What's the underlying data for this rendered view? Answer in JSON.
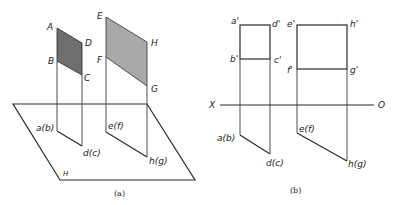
{
  "figure_a": {
    "caption": "(a)",
    "plane_symbol": "H",
    "labels": {
      "A": "A",
      "B": "B",
      "C": "C",
      "D": "D",
      "E": "E",
      "F": "F",
      "G": "G",
      "H": "H",
      "ab": "a(b)",
      "dc": "d(c)",
      "ef": "e(f)",
      "hg": "h(g)"
    },
    "colors": {
      "abcd_fill": "#6e6e6e",
      "efgh_fill": "#a9a9a9"
    }
  },
  "figure_b": {
    "caption": "(b)",
    "axis": {
      "left": "X",
      "right": "O"
    },
    "labels": {
      "a1": "a'",
      "b1": "b'",
      "c1": "c'",
      "d1": "d'",
      "e1": "e'",
      "f1": "f'",
      "g1": "g'",
      "h1": "h'",
      "ab": "a(b)",
      "dc": "d(c)",
      "ef": "e(f)",
      "hg": "h(g)"
    }
  }
}
